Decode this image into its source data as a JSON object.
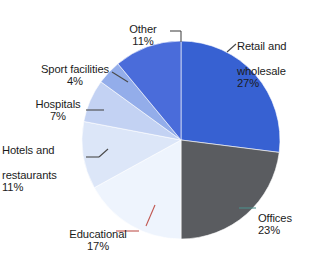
{
  "chart_data": {
    "type": "pie",
    "title": "",
    "subtitle": "",
    "xlabel": "",
    "ylabel": "",
    "legend_position": "none",
    "grid": false,
    "value_unit": "%",
    "start_angle_deg": 0,
    "direction": "clockwise",
    "categories": [
      "Retail and wholesale",
      "Offices",
      "Educational",
      "Hotels and restaurants",
      "Hospitals",
      "Sport facilities",
      "Other"
    ],
    "values": [
      27,
      23,
      17,
      11,
      7,
      4,
      11
    ],
    "colors": [
      "#3761D2",
      "#5a5c60",
      "#eef4fd",
      "#dce6f8",
      "#c3d2f3",
      "#93adea",
      "#4a6cda"
    ],
    "slices": [
      {
        "label": "Retail and wholesale",
        "label_line1": "Retail and",
        "label_line2": "wholesale",
        "value": 27,
        "value_text": "27%",
        "color": "#3761D2",
        "leader_color": "#4a4a4a"
      },
      {
        "label": "Offices",
        "label_line1": "Offices",
        "label_line2": "",
        "value": 23,
        "value_text": "23%",
        "color": "#5a5c60",
        "leader_color": "#4e8f8a"
      },
      {
        "label": "Educational",
        "label_line1": "Educational",
        "label_line2": "",
        "value": 17,
        "value_text": "17%",
        "color": "#eef4fd",
        "leader_color": "#c0554f"
      },
      {
        "label": "Hotels and restaurants",
        "label_line1": "Hotels and",
        "label_line2": "restaurants",
        "value": 11,
        "value_text": "11%",
        "color": "#dce6f8",
        "leader_color": "#4a4a4a"
      },
      {
        "label": "Hospitals",
        "label_line1": "Hospitals",
        "label_line2": "",
        "value": 7,
        "value_text": "7%",
        "color": "#c3d2f3",
        "leader_color": "#4a4a4a"
      },
      {
        "label": "Sport facilities",
        "label_line1": "Sport facilities",
        "label_line2": "",
        "value": 4,
        "value_text": "4%",
        "color": "#93adea",
        "leader_color": "#4a4a4a"
      },
      {
        "label": "Other",
        "label_line1": "Other",
        "label_line2": "",
        "value": 11,
        "value_text": "11%",
        "color": "#4a6cda",
        "leader_color": "#4a4a4a"
      }
    ],
    "total": 100,
    "geometry": {
      "center_x": 181,
      "center_y": 140,
      "radius": 99
    }
  }
}
